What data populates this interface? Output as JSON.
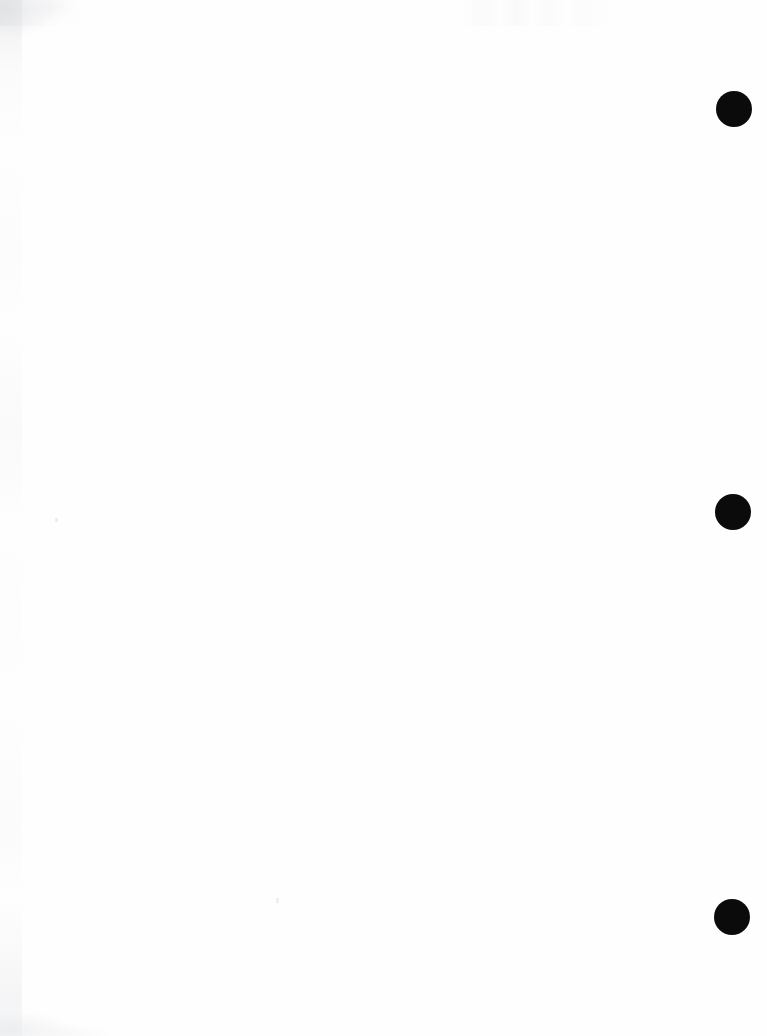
{
  "page": {
    "kind": "scanned-blank-page",
    "width": 767,
    "height": 1036,
    "background_color": "#fefefe",
    "content_text": "",
    "note": ""
  },
  "marks": {
    "color": "#0b0b0b",
    "shape": "filled-circle",
    "count": 3,
    "diameter": 36,
    "items": [
      {
        "name": "registration-mark-top",
        "cx": 734,
        "cy": 109,
        "d": 36
      },
      {
        "name": "registration-mark-middle",
        "cx": 733,
        "cy": 512,
        "d": 36
      },
      {
        "name": "registration-mark-bottom",
        "cx": 732,
        "cy": 917,
        "d": 36
      }
    ]
  },
  "artifacts": {
    "color": "#e9eaec",
    "specks": [
      {
        "name": "dust-speck-left",
        "x": 55,
        "y": 518,
        "w": 3,
        "h": 4
      },
      {
        "name": "dust-speck-center",
        "x": 276,
        "y": 898,
        "w": 3,
        "h": 5
      }
    ]
  }
}
